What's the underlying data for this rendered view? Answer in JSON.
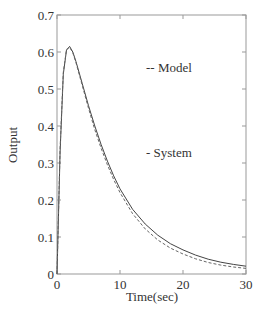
{
  "chart_data": {
    "type": "line",
    "title": "",
    "xlabel": "Time(sec)",
    "ylabel": "Output",
    "xlim": [
      0,
      30
    ],
    "ylim": [
      0,
      0.7
    ],
    "xticks": [
      0,
      10,
      20,
      30
    ],
    "yticks": [
      0,
      0.1,
      0.2,
      0.3,
      0.4,
      0.5,
      0.6,
      0.7
    ],
    "grid": false,
    "legend_position": "inside-upper-right (text annotations)",
    "annotations": [
      "-- Model",
      "-  System"
    ],
    "x": [
      0,
      0.5,
      1,
      1.5,
      2,
      2.5,
      3,
      4,
      5,
      6,
      7,
      8,
      9,
      10,
      12,
      14,
      16,
      18,
      20,
      22,
      24,
      26,
      28,
      30
    ],
    "series": [
      {
        "name": "System",
        "style": "solid",
        "values": [
          0,
          0.33,
          0.54,
          0.605,
          0.615,
          0.6,
          0.575,
          0.515,
          0.455,
          0.4,
          0.35,
          0.305,
          0.265,
          0.23,
          0.175,
          0.135,
          0.105,
          0.082,
          0.065,
          0.051,
          0.04,
          0.032,
          0.026,
          0.021
        ]
      },
      {
        "name": "Model",
        "style": "dashed",
        "values": [
          0,
          0.34,
          0.545,
          0.607,
          0.613,
          0.598,
          0.572,
          0.51,
          0.448,
          0.39,
          0.34,
          0.295,
          0.255,
          0.22,
          0.163,
          0.122,
          0.092,
          0.07,
          0.054,
          0.041,
          0.031,
          0.024,
          0.019,
          0.015
        ]
      }
    ]
  },
  "labels": {
    "xlabel": "Time(sec)",
    "ylabel": "Output",
    "legend_model": "-- Model",
    "legend_system": "-  System",
    "xtick_0": "0",
    "xtick_10": "10",
    "xtick_20": "20",
    "xtick_30": "30",
    "ytick_0": "0",
    "ytick_1": "0.1",
    "ytick_2": "0.2",
    "ytick_3": "0.3",
    "ytick_4": "0.4",
    "ytick_5": "0.5",
    "ytick_6": "0.6",
    "ytick_7": "0.7"
  }
}
